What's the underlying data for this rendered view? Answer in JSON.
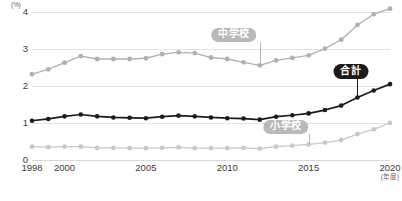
{
  "chart_data": {
    "type": "line",
    "title": "",
    "xlabel": "(年度)",
    "ylabel": "(%)",
    "ylim": [
      0,
      4
    ],
    "xlim": [
      1998,
      2020
    ],
    "grid": true,
    "yticks": [
      "4",
      "3",
      "2",
      "1",
      "0"
    ],
    "ytick_values": [
      4,
      3,
      2,
      1,
      0
    ],
    "xticks": [
      "1998",
      "2000",
      "2005",
      "2010",
      "2015",
      "2020"
    ],
    "xtick_values": [
      1998,
      2000,
      2005,
      2010,
      2015,
      2020
    ],
    "x": [
      1998,
      1999,
      2000,
      2001,
      2002,
      2003,
      2004,
      2005,
      2006,
      2007,
      2008,
      2009,
      2010,
      2011,
      2012,
      2013,
      2014,
      2015,
      2016,
      2017,
      2018,
      2019,
      2020
    ],
    "legend_position": "inline-annotations",
    "series": [
      {
        "name": "中学校",
        "color": "#b0b0b0",
        "values": [
          2.32,
          2.45,
          2.63,
          2.81,
          2.73,
          2.73,
          2.73,
          2.75,
          2.86,
          2.91,
          2.89,
          2.77,
          2.73,
          2.64,
          2.56,
          2.69,
          2.76,
          2.83,
          3.01,
          3.25,
          3.65,
          3.94,
          4.09
        ]
      },
      {
        "name": "合計",
        "color": "#1b1b1b",
        "values": [
          1.06,
          1.11,
          1.18,
          1.23,
          1.18,
          1.15,
          1.14,
          1.13,
          1.17,
          1.2,
          1.18,
          1.15,
          1.13,
          1.12,
          1.09,
          1.17,
          1.21,
          1.26,
          1.35,
          1.47,
          1.69,
          1.88,
          2.05
        ]
      },
      {
        "name": "小学校",
        "color": "#c8c8c8",
        "values": [
          0.36,
          0.35,
          0.36,
          0.36,
          0.33,
          0.33,
          0.32,
          0.32,
          0.33,
          0.34,
          0.32,
          0.32,
          0.32,
          0.33,
          0.31,
          0.36,
          0.39,
          0.42,
          0.47,
          0.54,
          0.7,
          0.83,
          1.0
        ]
      }
    ],
    "annotations": [
      {
        "label": "中学校",
        "style": "gray-pill",
        "at_year": 2012,
        "at_value": 2.56,
        "pill_x": 2010.4,
        "pill_y": 3.38
      },
      {
        "label": "合計",
        "style": "dark-pill",
        "at_year": 2018,
        "at_value": 1.69,
        "pill_x": 2017.6,
        "pill_y": 2.4
      },
      {
        "label": "小学校",
        "style": "gray-pill",
        "at_year": 2015,
        "at_value": 0.42,
        "pill_x": 2013.6,
        "pill_y": 0.9
      }
    ]
  }
}
